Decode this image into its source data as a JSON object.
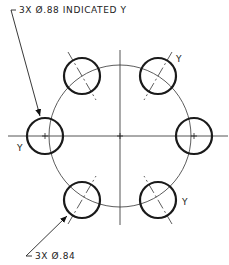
{
  "drawing": {
    "callout_top": {
      "text": "3X Ø.88 INDICATED Y"
    },
    "callout_bottom": {
      "text": "3X Ø.84"
    },
    "hole_labels": [
      "Y",
      "Y",
      "Y"
    ],
    "bolt_circle": {
      "cx": 120,
      "cy": 136,
      "r": 71
    },
    "holes": [
      {
        "cx": 45,
        "cy": 136,
        "r": 18,
        "label": "Y"
      },
      {
        "cx": 82,
        "cy": 76,
        "r": 18
      },
      {
        "cx": 158,
        "cy": 76,
        "r": 18,
        "label": "Y"
      },
      {
        "cx": 194,
        "cy": 136,
        "r": 18
      },
      {
        "cx": 158,
        "cy": 200,
        "r": 18,
        "label": "Y"
      },
      {
        "cx": 82,
        "cy": 200,
        "r": 18
      }
    ]
  }
}
